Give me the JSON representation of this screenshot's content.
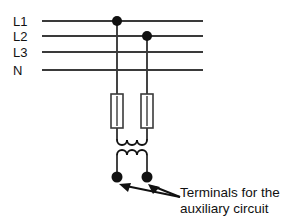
{
  "diagram": {
    "background_color": "#ffffff",
    "wire_color": "#3a3a3a",
    "symbol_color": "#111111",
    "bus_lines": [
      {
        "label": "L1",
        "y": 21,
        "tapped": true
      },
      {
        "label": "L2",
        "y": 36,
        "tapped": true
      },
      {
        "label": "L3",
        "y": 52,
        "tapped": false
      },
      {
        "label": "N",
        "y": 70,
        "tapped": false
      }
    ],
    "bus_geometry": {
      "x_start": 42,
      "x_end": 203,
      "label_x": 13
    },
    "taps": [
      {
        "from": "L1",
        "x": 117,
        "y": 21
      },
      {
        "from": "L2",
        "x": 147,
        "y": 36
      }
    ],
    "fuses": [
      {
        "name": "fuse-l1",
        "x": 117,
        "top": 94,
        "bottom": 128,
        "width": 12
      },
      {
        "name": "fuse-l2",
        "x": 147,
        "top": 94,
        "bottom": 128,
        "width": 12
      }
    ],
    "transformer": {
      "name": "control-transformer",
      "primary": {
        "x_left": 117,
        "x_right": 147,
        "y": 140,
        "turns": 3,
        "orientation": "arcs-down"
      },
      "secondary": {
        "x_left": 117,
        "x_right": 147,
        "y": 155,
        "turns": 3,
        "orientation": "arcs-up"
      },
      "core_gap_y": 148
    },
    "terminals": [
      {
        "name": "terminal-left",
        "x": 117,
        "y": 177
      },
      {
        "name": "terminal-right",
        "x": 147,
        "y": 177
      }
    ],
    "annotation": {
      "line1": "Terminals for the",
      "line2": "auxiliary circuit",
      "text_x": 180,
      "line1_y": 192,
      "line2_y": 208,
      "arrow_origin": {
        "x": 180,
        "y": 197
      },
      "arrows": [
        {
          "name": "arrow-to-left-terminal",
          "tip_x": 121,
          "tip_y": 184
        },
        {
          "name": "arrow-to-right-terminal",
          "tip_x": 150,
          "tip_y": 184
        }
      ]
    }
  }
}
